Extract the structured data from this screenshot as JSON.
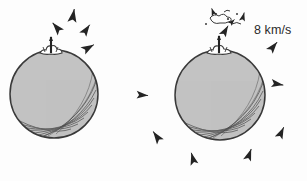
{
  "figure": {
    "style": "hand-drawn ink sketch",
    "background_color": "#fdfdfd",
    "ink_color": "#2b2b2b",
    "planet_fill": "#c3c3c3",
    "planet_outline": "#3a3a3a"
  },
  "annotations": {
    "velocity_label": "8 km/s"
  },
  "planets": [
    {
      "name": "left-planet",
      "cx": 54,
      "cy": 94,
      "r": 44,
      "plume": {
        "x": 51,
        "y": 50,
        "label": "eruption-plume"
      }
    },
    {
      "name": "right-planet",
      "cx": 220,
      "cy": 95,
      "r": 45,
      "plume": {
        "x": 219,
        "y": 50,
        "label": "eruption-plume"
      }
    }
  ],
  "debris": [
    {
      "x": 57,
      "y": 28,
      "rot": -40,
      "s": 1.0
    },
    {
      "x": 73,
      "y": 16,
      "rot": 10,
      "s": 1.05
    },
    {
      "x": 86,
      "y": 30,
      "rot": 35,
      "s": 0.95
    },
    {
      "x": 88,
      "y": 48,
      "rot": 60,
      "s": 1.0
    },
    {
      "x": 142,
      "y": 95,
      "rot": 95,
      "s": 0.9
    },
    {
      "x": 157,
      "y": 137,
      "rot": -35,
      "s": 1.0
    },
    {
      "x": 193,
      "y": 159,
      "rot": -15,
      "s": 0.95
    },
    {
      "x": 249,
      "y": 155,
      "rot": 20,
      "s": 0.95
    },
    {
      "x": 281,
      "y": 133,
      "rot": 25,
      "s": 0.95
    },
    {
      "x": 277,
      "y": 84,
      "rot": 100,
      "s": 0.95
    },
    {
      "x": 273,
      "y": 47,
      "rot": 40,
      "s": 0.95
    },
    {
      "x": 225,
      "y": 31,
      "rot": 30,
      "s": 0.9
    },
    {
      "x": 243,
      "y": 17,
      "rot": 15,
      "s": 0.7
    },
    {
      "x": 213,
      "y": 12,
      "rot": -20,
      "s": 0.6
    },
    {
      "x": 232,
      "y": 22,
      "rot": 45,
      "s": 0.55
    }
  ]
}
